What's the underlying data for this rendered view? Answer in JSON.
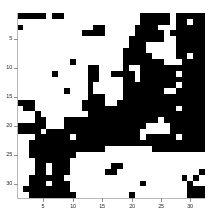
{
  "figure": {
    "kind": "binary-matrix-heatmap",
    "background_color": "#ffffff",
    "on_color": "#000000",
    "off_color": "#ffffff",
    "axis_color": "#b9b9b9",
    "tick_text_color": "#2b2b2b"
  },
  "chart_data": {
    "type": "heatmap",
    "title": "",
    "subtitle": "",
    "xlabel": "",
    "ylabel": "",
    "grid": false,
    "legend": null,
    "legend_position": "none",
    "colormap": "binary",
    "value_labels": {
      "0": "white",
      "1": "black"
    },
    "nrows": 32,
    "ncols": 32,
    "xlim": [
      0.5,
      32.5
    ],
    "ylim": [
      32.5,
      0.5
    ],
    "y_axis_inverted": true,
    "xticks": [
      5,
      10,
      15,
      20,
      25,
      30
    ],
    "yticks": [
      5,
      10,
      15,
      20,
      25,
      30
    ],
    "xticklabels": [
      "5",
      "10",
      "15",
      "20",
      "25",
      "30"
    ],
    "yticklabels": [
      "5",
      "10",
      "15",
      "20",
      "25",
      "30"
    ],
    "rows": [
      "11111011000000000000011111011111",
      "00000000000000000000011111011011",
      "10000000000001100000111100011111",
      "00000000000111100000111110111111",
      "00000000000000000001111110011111",
      "00000000000000000001110000011111",
      "00000000000000000011110000011111",
      "00000000000000000011111000011011",
      "00000000010000000011111110001111",
      "00000000000011000010011111111111",
      "00000010000011001111011111101111",
      "00000000000011000011011111111111",
      "00000000000010000011111111101111",
      "00000000100010000011111110011111",
      "00000000000011100011111111111111",
      "11100000000111100111111111111111",
      "01100000000111111111111111101111",
      "00010000000011111111111111111111",
      "00011000111111111111111101111111",
      "11111000111111111111110000111111",
      "11110111111111111111100000111111",
      "00011111101111111111101111101111",
      "00111111111111111111111111111111",
      "00111111111111100000000111111111",
      "00111111110000000000000000000000",
      "00011111100000000000000000000000",
      "00011011100000001100000000000000",
      "00011011100000011000000000000001",
      "00111111000000000000000000001010",
      "00111011100000000000010000000100",
      "01111111100000000000000000000111",
      "00111111110000000001000000000111"
    ]
  },
  "ticks": {
    "y": [
      {
        "label": "5",
        "row": 5
      },
      {
        "label": "10",
        "row": 10
      },
      {
        "label": "15",
        "row": 15
      },
      {
        "label": "20",
        "row": 20
      },
      {
        "label": "25",
        "row": 25
      },
      {
        "label": "30",
        "row": 30
      }
    ],
    "x": [
      {
        "label": "5",
        "col": 5
      },
      {
        "label": "10",
        "col": 10
      },
      {
        "label": "15",
        "col": 15
      },
      {
        "label": "20",
        "col": 20
      },
      {
        "label": "25",
        "col": 25
      },
      {
        "label": "30",
        "col": 30
      }
    ]
  }
}
